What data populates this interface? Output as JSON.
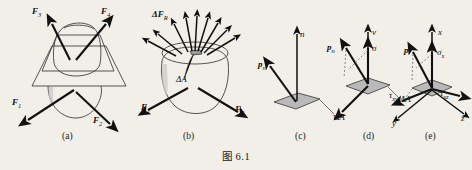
{
  "figure": {
    "caption": "图 6.1",
    "background_color": "#f2efe9",
    "ink_color": "#2b2b2b",
    "area_fill_color": "#b9b9b9"
  },
  "panels": [
    {
      "id": "a",
      "sublabel": "(a)",
      "description": "body cut by a section plane with external forces",
      "labels": [
        {
          "name": "force-f3",
          "text": "F",
          "sub": "3"
        },
        {
          "name": "force-f4",
          "text": "F",
          "sub": "4"
        },
        {
          "name": "force-f1",
          "text": "F",
          "sub": "1"
        },
        {
          "name": "force-f2",
          "text": "F",
          "sub": "2"
        }
      ]
    },
    {
      "id": "b",
      "sublabel": "(b)",
      "description": "lower part of body showing internal force distribution on cut surface",
      "labels": [
        {
          "name": "resultant-delta-fr",
          "text": "ΔF",
          "sub": "R"
        },
        {
          "name": "area-delta-a",
          "text": "ΔA",
          "sub": ""
        },
        {
          "name": "force-f1",
          "text": "F",
          "sub": "1"
        },
        {
          "name": "force-f2",
          "text": "F",
          "sub": "2"
        }
      ]
    },
    {
      "id": "c",
      "sublabel": "(c)",
      "description": "elemental area with normal direction and full stress vector",
      "labels": [
        {
          "name": "normal-n",
          "text": "n",
          "sub": ""
        },
        {
          "name": "stress-vector-pn",
          "text": "p",
          "sub": "n"
        },
        {
          "name": "area-delta-a",
          "text": "ΔA",
          "sub": ""
        }
      ]
    },
    {
      "id": "d",
      "sublabel": "(d)",
      "description": "stress vector resolved into normal stress sigma and shear stress tau",
      "labels": [
        {
          "name": "normal-v",
          "text": "v",
          "sub": ""
        },
        {
          "name": "normal-stress-sigma",
          "text": "σ",
          "sub": ""
        },
        {
          "name": "stress-vector-pn",
          "text": "p",
          "sub": "n"
        },
        {
          "name": "shear-stress-tau",
          "text": "τ",
          "sub": ""
        },
        {
          "name": "area-delta-a",
          "text": "ΔA",
          "sub": ""
        }
      ]
    },
    {
      "id": "e",
      "sublabel": "(e)",
      "description": "stress components in xyz cartesian coordinate system",
      "labels": [
        {
          "name": "axis-x",
          "text": "x",
          "sub": ""
        },
        {
          "name": "axis-y",
          "text": "y",
          "sub": ""
        },
        {
          "name": "axis-z",
          "text": "z",
          "sub": ""
        },
        {
          "name": "stress-vector-p",
          "text": "p",
          "sub": ""
        },
        {
          "name": "normal-stress-sigma-x",
          "text": "σ",
          "sub": "x"
        },
        {
          "name": "shear-stress-tau-xy",
          "text": "τ",
          "sub": "xy"
        },
        {
          "name": "shear-stress-tau-xz",
          "text": "τ",
          "sub": "xz"
        }
      ]
    }
  ]
}
